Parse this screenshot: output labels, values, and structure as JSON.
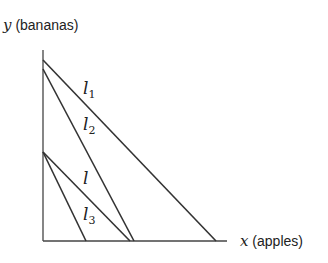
{
  "axes": {
    "y_var": "y",
    "y_label": "(bananas)",
    "x_var": "x",
    "x_label": "(apples)"
  },
  "lines": [
    {
      "name": "l",
      "sub": "1",
      "from": [
        43,
        60
      ],
      "to": [
        216,
        241
      ]
    },
    {
      "name": "l",
      "sub": "2",
      "from": [
        43,
        69
      ],
      "to": [
        134,
        241
      ]
    },
    {
      "name": "l",
      "sub": "",
      "from": [
        43,
        152
      ],
      "to": [
        130,
        241
      ]
    },
    {
      "name": "l",
      "sub": "3",
      "from": [
        43,
        152
      ],
      "to": [
        86,
        241
      ]
    }
  ],
  "colors": {
    "line": "#333333"
  }
}
